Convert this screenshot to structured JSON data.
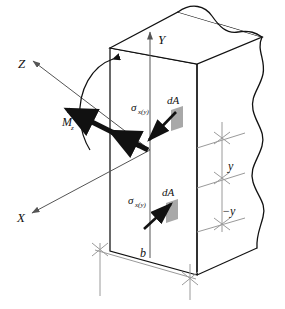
{
  "figure": {
    "kind": "engineering-diagram",
    "background_color": "#ffffff",
    "line_color": "#111111",
    "axis_color": "#555555",
    "dimension_color": "#9a9a9a",
    "patch_fill": "#a8a8a8",
    "vector_color": "#111111"
  },
  "axes": [
    {
      "name": "z-axis",
      "label": "Z",
      "direction": "upper-left",
      "arrow": "outward"
    },
    {
      "name": "y-axis",
      "label": "Y",
      "direction": "up",
      "arrow": "outward"
    },
    {
      "name": "x-axis",
      "label": "X",
      "direction": "lower-left",
      "arrow": "outward"
    }
  ],
  "moment": {
    "label": "M",
    "subscript": "z",
    "name": "bending-moment",
    "rotation_arrow": "curved-clockwise",
    "vector": "double-headed-thick-along-z"
  },
  "stresses": [
    {
      "name": "stress-above-neutral-axis",
      "symbol": "σ",
      "subscript": "x(y)",
      "sense": "compression",
      "arrow_direction": "toward-section-down-left",
      "area_label": "dA"
    },
    {
      "name": "stress-below-neutral-axis",
      "symbol": "σ",
      "subscript": "x(y)",
      "sense": "tension",
      "arrow_direction": "away-from-section-up-right",
      "area_label": "dA"
    }
  ],
  "area_elements": [
    {
      "label": "dA",
      "position": "upper"
    },
    {
      "label": "dA",
      "position": "lower"
    }
  ],
  "dimensions": [
    {
      "name": "distance-above-neutral-axis",
      "label": "y"
    },
    {
      "name": "distance-below-neutral-axis",
      "label": "−y"
    },
    {
      "name": "section-width",
      "label": "b"
    }
  ],
  "body": {
    "name": "beam-segment",
    "shape": "rectangular-prism-with-broken-right-end",
    "break_edges": "wavy"
  }
}
